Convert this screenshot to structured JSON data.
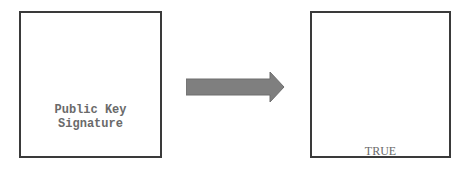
{
  "diagram": {
    "left_box": {
      "lines": [
        "Public Key",
        "Signature"
      ]
    },
    "arrow": {
      "direction": "right",
      "color": "#7f7f7f",
      "icon": "right-arrow-icon"
    },
    "right_box": {
      "label": "TRUE"
    }
  }
}
